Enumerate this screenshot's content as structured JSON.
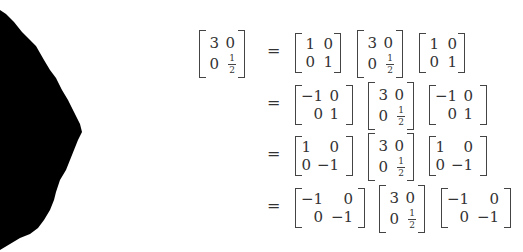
{
  "figure": {
    "lhs": {
      "a": "3",
      "b": "0",
      "c": "0",
      "d_num": "1",
      "d_den": "2"
    },
    "equals": "=",
    "rows": [
      {
        "left": {
          "a": "1",
          "b": "0",
          "c": "0",
          "d": "1"
        },
        "middle": {
          "a": "3",
          "b": "0",
          "c": "0",
          "d_num": "1",
          "d_den": "2"
        },
        "right": {
          "a": "1",
          "b": "0",
          "c": "0",
          "d": "1"
        }
      },
      {
        "left": {
          "a": "−1",
          "b": "0",
          "c": "0",
          "d": "1"
        },
        "middle": {
          "a": "3",
          "b": "0",
          "c": "0",
          "d_num": "1",
          "d_den": "2"
        },
        "right": {
          "a": "−1",
          "b": "0",
          "c": "0",
          "d": "1"
        }
      },
      {
        "left": {
          "a": "1",
          "b": "0",
          "c": "0",
          "d": "−1"
        },
        "middle": {
          "a": "3",
          "b": "0",
          "c": "0",
          "d_num": "1",
          "d_den": "2"
        },
        "right": {
          "a": "1",
          "b": "0",
          "c": "0",
          "d": "−1"
        }
      },
      {
        "left": {
          "a": "−1",
          "b": "0",
          "c": "0",
          "d": "−1"
        },
        "middle": {
          "a": "3",
          "b": "0",
          "c": "0",
          "d_num": "1",
          "d_den": "2"
        },
        "right": {
          "a": "−1",
          "b": "0",
          "c": "0",
          "d": "−1"
        }
      }
    ]
  },
  "decoration": {
    "blob_color": "#000000"
  }
}
